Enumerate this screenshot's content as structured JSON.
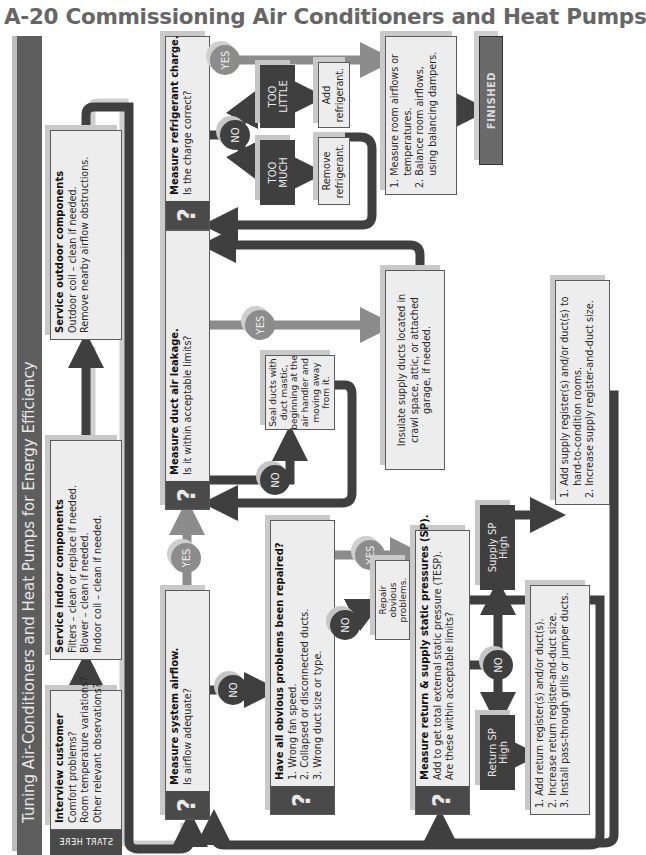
{
  "page": {
    "title": "A-20 Commissioning Air Conditioners and Heat Pumps"
  },
  "banner": {
    "title": "Tuning Air-Conditioners and Heat Pumps for Energy Efficiency",
    "start_label": "START HERE"
  },
  "colors": {
    "dark": "#3f3f3f",
    "banner": "#5e5e5e",
    "box_fill": "#ededed",
    "yes_arrow": "#8c8c8c",
    "no_arrow": "#3f3f3f",
    "shadow": "#c9c9c9"
  },
  "steps": {
    "interview": {
      "title": "Interview customer",
      "lines": [
        "Comfort problems?",
        "Room temperature variations?",
        "Other relevant observations?"
      ]
    },
    "indoor": {
      "title": "Service indoor components",
      "lines": [
        "Filters – clean or replace if needed.",
        "Blower – clean if needed.",
        "Indoor coil – clean if needed."
      ]
    },
    "outdoor": {
      "title": "Service outdoor components",
      "lines": [
        "Outdoor coil – clean if needed.",
        "Remove nearby airflow  obstructions."
      ]
    },
    "airflow": {
      "icon": "?",
      "title": "Measure system airflow.",
      "question": "Is airflow adequate?"
    },
    "obvious": {
      "icon": "?",
      "title": "Have all obvious problems been repaired?",
      "lines": [
        "1. Wrong fan speed.",
        "2. Collapsed or disconnected ducts.",
        "3. Wrong duct size or type."
      ]
    },
    "repair": {
      "lines": [
        "Repair",
        "obvious",
        "problems."
      ]
    },
    "static_pressure": {
      "icon": "?",
      "title": "Measure return & supply static pressures (SP).",
      "lines": [
        "Add to get total external static pressure (TESP).",
        "Are these within acceptable limits?"
      ]
    },
    "return_high": {
      "lines": [
        "Return SP",
        "High"
      ]
    },
    "supply_high": {
      "lines": [
        "Supply SP",
        "High"
      ]
    },
    "return_fixes": {
      "lines": [
        "1. Add return register(s) and/or duct(s).",
        "2. Increase return register-and-duct size.",
        "3. Install pass-through grills or jumper ducts."
      ]
    },
    "supply_fixes": {
      "lines": [
        "1. Add supply register(s) and/or duct(s) to",
        "    hard-to-condition rooms.",
        "2. Increase supply register-and-duct size."
      ]
    },
    "leakage": {
      "icon": "?",
      "title": "Measure duct air leakage.",
      "question": "Is it within acceptable limits?"
    },
    "seal": {
      "lines": [
        "Seal ducts with",
        "duct mastic,",
        "beginning at the",
        "air handler and",
        "moving away",
        "from it."
      ]
    },
    "insulate": {
      "lines": [
        "Insulate supply ducts located in",
        "crawl space, attic, or attached",
        "garage, if needed."
      ]
    },
    "refrigerant": {
      "icon": "?",
      "title": "Measure refrigerant charge.",
      "question": "Is the charge correct?"
    },
    "too_much": {
      "lines": [
        "TOO",
        "MUCH"
      ]
    },
    "too_little": {
      "lines": [
        "TOO",
        "LITTLE"
      ]
    },
    "remove": {
      "lines": [
        "Remove",
        "refrigerant."
      ]
    },
    "add": {
      "lines": [
        "Add",
        "refrigerant."
      ]
    },
    "balance": {
      "lines": [
        "1. Measure room airflows or",
        "    temperatures.",
        "2. Balance room airflows,",
        "    using balancing dampers."
      ]
    },
    "finished": {
      "label": "FINISHED"
    }
  },
  "decisions": {
    "yes": "YES",
    "no": "NO"
  }
}
